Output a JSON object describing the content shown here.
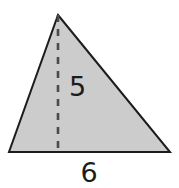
{
  "figure": {
    "type": "geometry-diagram",
    "shape": "triangle",
    "background_color": "#ffffff",
    "fill_color": "#cccccc",
    "stroke_color": "#1c1c1c",
    "stroke_width": 2,
    "dash_color": "#4a4a4a",
    "label_color": "#1c1c1c",
    "vertices": {
      "apex": {
        "x": 58,
        "y": 15
      },
      "bottom_left": {
        "x": 9,
        "y": 152
      },
      "bottom_right": {
        "x": 170,
        "y": 152
      }
    },
    "altitude": {
      "name": "height-dashed-line",
      "x": 58,
      "y_top": 15,
      "y_bottom": 152,
      "style": "dashed",
      "dash_pattern": "7 7"
    },
    "labels": {
      "height": {
        "text": "5",
        "x": 69,
        "y": 96,
        "anchor": "start",
        "meaning": "triangle height"
      },
      "base": {
        "text": "6",
        "x": 89,
        "y": 182,
        "anchor": "middle",
        "meaning": "triangle base length"
      }
    }
  }
}
